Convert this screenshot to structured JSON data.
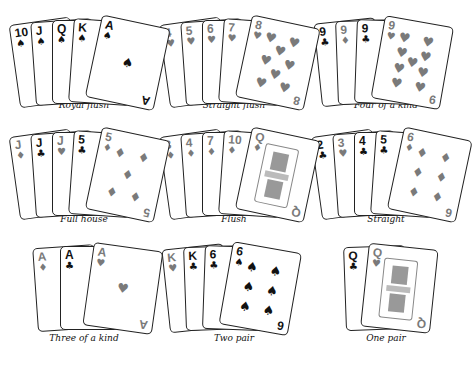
{
  "hands": [
    {
      "label": "Royal flush",
      "cards": [
        {
          "rank": "10",
          "suit": "♠",
          "color": "black"
        },
        {
          "rank": "J",
          "suit": "♠",
          "color": "black"
        },
        {
          "rank": "Q",
          "suit": "♠",
          "color": "black"
        },
        {
          "rank": "K",
          "suit": "♠",
          "color": "black"
        },
        {
          "rank": "A",
          "suit": "♠",
          "color": "black"
        }
      ]
    },
    {
      "label": "Straight flush",
      "cards": [
        {
          "rank": "4",
          "suit": "♥",
          "color": "gray"
        },
        {
          "rank": "5",
          "suit": "♥",
          "color": "gray"
        },
        {
          "rank": "6",
          "suit": "♥",
          "color": "gray"
        },
        {
          "rank": "7",
          "suit": "♥",
          "color": "gray"
        },
        {
          "rank": "8",
          "suit": "♥",
          "color": "gray"
        }
      ]
    },
    {
      "label": "Four of a kind",
      "cards": [
        {
          "rank": "9",
          "suit": "♣",
          "color": "black"
        },
        {
          "rank": "9",
          "suit": "♦",
          "color": "gray"
        },
        {
          "rank": "9",
          "suit": "♣",
          "color": "black"
        },
        {
          "rank": "9",
          "suit": "♥",
          "color": "gray"
        }
      ]
    },
    {
      "label": "Full house",
      "cards": [
        {
          "rank": "J",
          "suit": "♦",
          "color": "gray"
        },
        {
          "rank": "J",
          "suit": "♣",
          "color": "black"
        },
        {
          "rank": "J",
          "suit": "♥",
          "color": "gray"
        },
        {
          "rank": "5",
          "suit": "♣",
          "color": "black"
        },
        {
          "rank": "5",
          "suit": "♦",
          "color": "gray"
        }
      ]
    },
    {
      "label": "Flush",
      "cards": [
        {
          "rank": "3",
          "suit": "♦",
          "color": "gray"
        },
        {
          "rank": "4",
          "suit": "♦",
          "color": "gray"
        },
        {
          "rank": "7",
          "suit": "♦",
          "color": "gray"
        },
        {
          "rank": "10",
          "suit": "♦",
          "color": "gray"
        },
        {
          "rank": "Q",
          "suit": "♦",
          "color": "gray"
        }
      ]
    },
    {
      "label": "Straight",
      "cards": [
        {
          "rank": "2",
          "suit": "♣",
          "color": "black"
        },
        {
          "rank": "3",
          "suit": "♥",
          "color": "gray"
        },
        {
          "rank": "4",
          "suit": "♣",
          "color": "black"
        },
        {
          "rank": "5",
          "suit": "♣",
          "color": "black"
        },
        {
          "rank": "6",
          "suit": "♦",
          "color": "gray"
        }
      ]
    },
    {
      "label": "Three of a kind",
      "cards": [
        {
          "rank": "A",
          "suit": "♦",
          "color": "gray"
        },
        {
          "rank": "A",
          "suit": "♣",
          "color": "black"
        },
        {
          "rank": "A",
          "suit": "♥",
          "color": "gray"
        }
      ]
    },
    {
      "label": "Two pair",
      "cards": [
        {
          "rank": "K",
          "suit": "♥",
          "color": "gray"
        },
        {
          "rank": "K",
          "suit": "♣",
          "color": "black"
        },
        {
          "rank": "6",
          "suit": "♣",
          "color": "black"
        },
        {
          "rank": "6",
          "suit": "♠",
          "color": "black"
        }
      ]
    },
    {
      "label": "One pair",
      "cards": [
        {
          "rank": "Q",
          "suit": "♣",
          "color": "black"
        },
        {
          "rank": "Q",
          "suit": "♥",
          "color": "gray"
        }
      ]
    }
  ]
}
